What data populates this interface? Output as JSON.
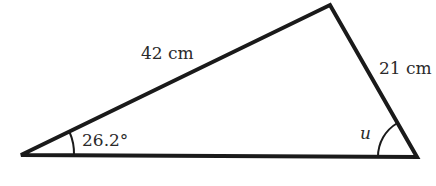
{
  "diagram": {
    "type": "triangle",
    "stroke_color": "#1a1a1a",
    "vertices": {
      "left": [
        21,
        155
      ],
      "top": [
        330,
        5
      ],
      "right": [
        417,
        157
      ]
    },
    "sides": {
      "left_top": {
        "label": "42 cm"
      },
      "top_right": {
        "label": "21 cm"
      }
    },
    "angles": {
      "left": {
        "label": "26.2°"
      },
      "right": {
        "label": "u"
      }
    }
  }
}
